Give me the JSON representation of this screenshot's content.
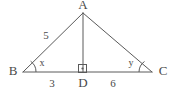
{
  "figure": {
    "type": "geometry-diagram",
    "shape": "triangle-with-altitude",
    "background_color": "#ffffff",
    "line_color": "#5a5a5a",
    "text_color": "#4a4a4a"
  },
  "vertices": {
    "apex": {
      "label": "A",
      "x": 83,
      "y": 13,
      "label_x": 83,
      "label_y": 6
    },
    "left": {
      "label": "B",
      "x": 23,
      "y": 72,
      "label_x": 13,
      "label_y": 72
    },
    "right": {
      "label": "C",
      "x": 152,
      "y": 72,
      "label_x": 163,
      "label_y": 72
    },
    "foot": {
      "label": "D",
      "x": 83,
      "y": 72,
      "label_x": 83,
      "label_y": 84
    }
  },
  "segments": {
    "ab_length_label": "5",
    "ab_label_x": 46,
    "ab_label_y": 36,
    "bd_length_label": "3",
    "bd_label_x": 52,
    "bd_label_y": 84,
    "dc_length_label": "6",
    "dc_label_x": 113,
    "dc_label_y": 84
  },
  "angles": {
    "at_b": {
      "label": "x",
      "label_x": 42,
      "label_y": 64
    },
    "at_c": {
      "label": "y",
      "label_x": 131,
      "label_y": 64
    },
    "at_d": {
      "label": "right-angle",
      "marker": "square-with-dot"
    }
  }
}
